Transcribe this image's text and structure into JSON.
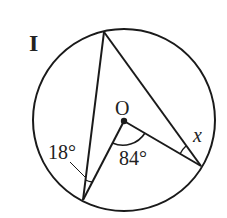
{
  "problem_label": "I",
  "center_label": "O",
  "angles": {
    "inscribed_left": "18°",
    "central": "84°",
    "unknown": "x"
  },
  "colors": {
    "stroke": "#1a1a1a",
    "background": "#ffffff"
  }
}
